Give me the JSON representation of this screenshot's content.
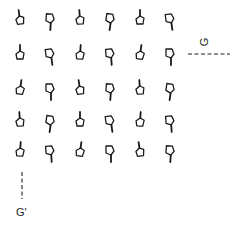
{
  "diagram": {
    "grid": {
      "rows": 5,
      "cols": 6,
      "col_x": [
        20,
        50,
        80,
        110,
        140,
        170
      ],
      "row_y": [
        20,
        55,
        90,
        122,
        152
      ],
      "cells": [
        [
          "stem-up",
          "stem-down",
          "stem-up",
          "stem-down",
          "stem-up",
          "stem-down"
        ],
        [
          "stem-up",
          "stem-down",
          "stem-up",
          "stem-down",
          "stem-up",
          "stem-down"
        ],
        [
          "stem-up",
          "stem-down",
          "stem-up",
          "stem-down",
          "stem-up",
          "stem-down"
        ],
        [
          "stem-up",
          "stem-down",
          "stem-up",
          "stem-down",
          "stem-up",
          "stem-down"
        ],
        [
          "stem-up",
          "stem-down",
          "stem-up",
          "stem-down",
          "stem-up",
          "stem-down"
        ]
      ]
    },
    "axis_g": {
      "label": "G",
      "orientation": "horizontal-dashed"
    },
    "axis_g_prime": {
      "label": "G'",
      "orientation": "vertical-dashed"
    },
    "colors": {
      "stroke": "#1a1a1a",
      "background": "#ffffff"
    }
  }
}
